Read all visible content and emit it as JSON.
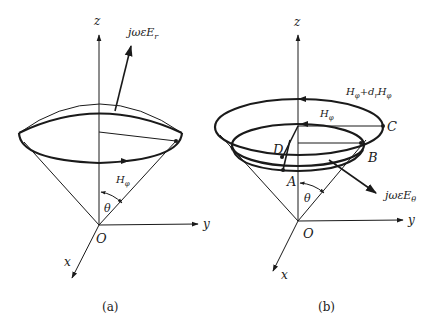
{
  "figure": {
    "panel_a": {
      "caption": "(a)",
      "axes": {
        "z": "z",
        "y": "y",
        "x": "x",
        "origin": "O"
      },
      "labels": {
        "field_E": "jωεE",
        "field_E_sub": "r",
        "field_H": "H",
        "field_H_sub": "φ",
        "angle": "θ"
      }
    },
    "panel_b": {
      "caption": "(b)",
      "axes": {
        "z": "z",
        "y": "y",
        "x": "x",
        "origin": "O"
      },
      "labels": {
        "outer_H": "H",
        "outer_H_sub": "φ",
        "outer_plus": "+d",
        "outer_plus_sub": "r",
        "outer_H2": "H",
        "outer_H2_sub": "φ",
        "inner_H": "H",
        "inner_H_sub": "φ",
        "field_E": "jωεE",
        "field_E_sub": "θ",
        "angle": "θ",
        "point_A": "A",
        "point_B": "B",
        "point_C": "C",
        "point_D": "D"
      }
    },
    "colors": {
      "ink": "#1a1a1a",
      "background": "#ffffff"
    }
  }
}
